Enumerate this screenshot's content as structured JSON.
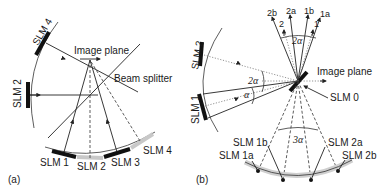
{
  "panel_a": {
    "label": "(a)",
    "image_plane": "Image plane",
    "beam_splitter": "Beam splitter",
    "slm_labels": {
      "slm4_top": "SLM 4",
      "slm2_left": "SLM 2",
      "slm1": "SLM 1",
      "slm2": "SLM 2",
      "slm3": "SLM 3",
      "slm4": "SLM 4"
    }
  },
  "panel_b": {
    "label": "(b)",
    "image_plane": "Image plane",
    "slm0": "SLM 0",
    "slm2_left": "SLM 2",
    "slm1_left": "SLM 1",
    "beam_labels": [
      "2b",
      "2a",
      "1b",
      "1a"
    ],
    "order_labels": [
      "2",
      "1"
    ],
    "angles": {
      "top": "2α",
      "left_large": "2α",
      "left_small": "α",
      "bottom": "3α"
    },
    "bottom_slm_labels": [
      "SLM 1b",
      "SLM 1a",
      "SLM 2a",
      "SLM 2b"
    ]
  }
}
